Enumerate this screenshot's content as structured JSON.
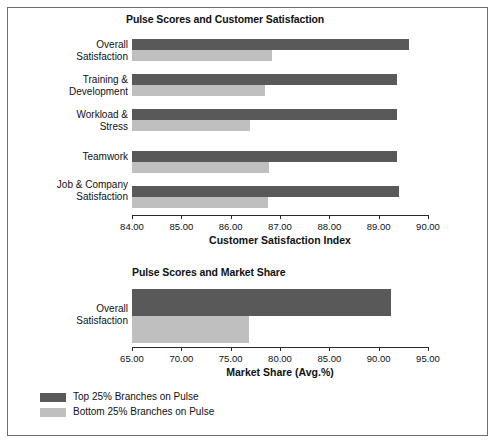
{
  "figure": {
    "background": "#ffffff",
    "border_color": "#6e6e6e",
    "series_colors": {
      "top": "#595959",
      "bottom": "#bfbfbf"
    }
  },
  "legend": {
    "items": [
      {
        "label": "Top 25% Branches on Pulse",
        "color": "#595959",
        "key": "top"
      },
      {
        "label": "Bottom 25% Branches on Pulse",
        "color": "#bfbfbf",
        "key": "bottom"
      }
    ]
  },
  "chart_data": [
    {
      "type": "bar",
      "orientation": "horizontal",
      "title": "Pulse Scores and Customer Satisfaction",
      "xlabel": "Customer Satisfaction Index",
      "ylabel": "",
      "xlim": [
        84.0,
        90.0
      ],
      "xticks": [
        84.0,
        85.0,
        86.0,
        87.0,
        88.0,
        89.0,
        90.0
      ],
      "xtick_labels": [
        "84.00",
        "85.00",
        "86.00",
        "87.00",
        "88.00",
        "89.00",
        "90.00"
      ],
      "grid": false,
      "legend_position": "below-figure",
      "categories": [
        "Overall\nSatisfaction",
        "Training &\nDevelopment",
        "Workload &\nStress",
        "Teamwork",
        "Job & Company\nSatisfaction"
      ],
      "series": [
        {
          "name": "Top 25% Branches on Pulse",
          "color": "#595959",
          "values": [
            89.62,
            89.38,
            89.38,
            89.38,
            89.42
          ]
        },
        {
          "name": "Bottom 25% Branches on Pulse",
          "color": "#bfbfbf",
          "values": [
            86.83,
            86.7,
            86.4,
            86.78,
            86.76
          ]
        }
      ]
    },
    {
      "type": "bar",
      "orientation": "horizontal",
      "title": "Pulse Scores and Market Share",
      "xlabel": "Market Share (Avg.%)",
      "ylabel": "",
      "xlim": [
        65.0,
        95.0
      ],
      "xticks": [
        65.0,
        70.0,
        75.0,
        80.0,
        85.0,
        90.0,
        95.0
      ],
      "xtick_labels": [
        "65.00",
        "70.00",
        "75.00",
        "80.00",
        "85.00",
        "90.00",
        "95.00"
      ],
      "grid": false,
      "legend_position": "below-figure",
      "categories": [
        "Overall\nSatisfaction"
      ],
      "series": [
        {
          "name": "Top 25% Branches on Pulse",
          "color": "#595959",
          "values": [
            91.3
          ]
        },
        {
          "name": "Bottom 25% Branches on Pulse",
          "color": "#bfbfbf",
          "values": [
            76.9
          ]
        }
      ]
    }
  ]
}
